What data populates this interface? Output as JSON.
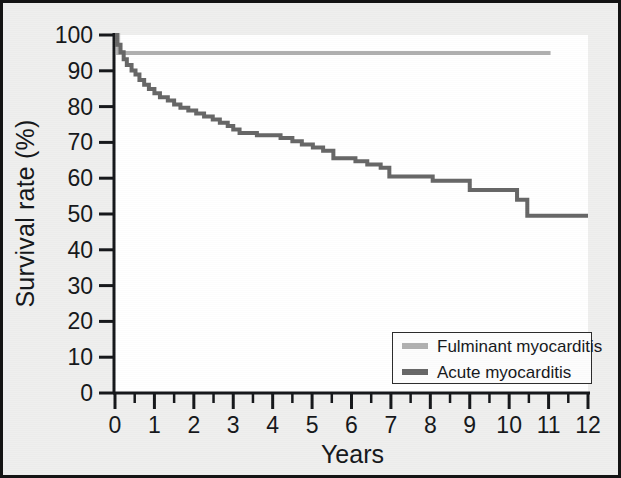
{
  "chart_data": {
    "type": "line",
    "title": "",
    "subtitle": "",
    "xlabel": "Years",
    "ylabel": "Survival rate (%)",
    "xlim": [
      0,
      12
    ],
    "ylim": [
      0,
      100
    ],
    "xticks": [
      0,
      1,
      2,
      3,
      4,
      5,
      6,
      7,
      8,
      9,
      10,
      11,
      12
    ],
    "xtick_labels": [
      "0",
      "1",
      "2",
      "3",
      "4",
      "5",
      "6",
      "7",
      "8",
      "9",
      "10",
      "11",
      "12"
    ],
    "minor_xtick_interval": 0.5,
    "yticks": [
      0,
      10,
      20,
      30,
      40,
      50,
      60,
      70,
      80,
      90,
      100
    ],
    "ytick_labels": [
      "0",
      "10",
      "20",
      "30",
      "40",
      "50",
      "60",
      "70",
      "80",
      "90",
      "100"
    ],
    "grid": false,
    "legend_position": "lower right",
    "plot_style": "kaplan-meier step curve",
    "series": [
      {
        "name": "Fulminant myocarditis",
        "color": "#b0b0b0",
        "line_width": 4,
        "ends_at_x": 11.05,
        "points": [
          [
            0.0,
            100.0
          ],
          [
            0.08,
            100.0
          ],
          [
            0.08,
            95.0
          ],
          [
            11.05,
            95.0
          ]
        ]
      },
      {
        "name": "Acute myocarditis",
        "color": "#666666",
        "line_width": 4,
        "ends_at_x": 12.0,
        "points": [
          [
            0.0,
            100.0
          ],
          [
            0.05,
            100.0
          ],
          [
            0.05,
            97.3
          ],
          [
            0.14,
            97.3
          ],
          [
            0.14,
            95.2
          ],
          [
            0.22,
            95.2
          ],
          [
            0.22,
            93.2
          ],
          [
            0.3,
            93.2
          ],
          [
            0.3,
            91.6
          ],
          [
            0.42,
            91.6
          ],
          [
            0.42,
            90.1
          ],
          [
            0.52,
            90.1
          ],
          [
            0.52,
            89.0
          ],
          [
            0.62,
            89.0
          ],
          [
            0.62,
            87.4
          ],
          [
            0.74,
            87.4
          ],
          [
            0.74,
            86.1
          ],
          [
            0.86,
            86.1
          ],
          [
            0.86,
            84.9
          ],
          [
            1.0,
            84.9
          ],
          [
            1.0,
            83.7
          ],
          [
            1.14,
            83.7
          ],
          [
            1.14,
            82.6
          ],
          [
            1.34,
            82.6
          ],
          [
            1.34,
            81.7
          ],
          [
            1.5,
            81.7
          ],
          [
            1.5,
            80.6
          ],
          [
            1.66,
            80.6
          ],
          [
            1.66,
            79.7
          ],
          [
            1.86,
            79.7
          ],
          [
            1.86,
            78.9
          ],
          [
            2.06,
            78.9
          ],
          [
            2.06,
            78.1
          ],
          [
            2.26,
            78.1
          ],
          [
            2.26,
            77.2
          ],
          [
            2.48,
            77.2
          ],
          [
            2.48,
            76.4
          ],
          [
            2.66,
            76.4
          ],
          [
            2.66,
            75.5
          ],
          [
            2.86,
            75.5
          ],
          [
            2.86,
            74.6
          ],
          [
            3.0,
            74.6
          ],
          [
            3.0,
            73.6
          ],
          [
            3.16,
            73.6
          ],
          [
            3.16,
            72.6
          ],
          [
            3.6,
            72.6
          ],
          [
            3.6,
            72.0
          ],
          [
            4.2,
            72.0
          ],
          [
            4.2,
            71.2
          ],
          [
            4.5,
            71.2
          ],
          [
            4.5,
            70.3
          ],
          [
            4.74,
            70.3
          ],
          [
            4.74,
            69.4
          ],
          [
            5.02,
            69.4
          ],
          [
            5.02,
            68.6
          ],
          [
            5.28,
            68.6
          ],
          [
            5.28,
            67.7
          ],
          [
            5.54,
            67.7
          ],
          [
            5.54,
            65.6
          ],
          [
            6.1,
            65.6
          ],
          [
            6.1,
            64.7
          ],
          [
            6.4,
            64.7
          ],
          [
            6.4,
            63.8
          ],
          [
            6.74,
            63.8
          ],
          [
            6.74,
            62.9
          ],
          [
            6.96,
            62.9
          ],
          [
            6.96,
            60.5
          ],
          [
            8.06,
            60.5
          ],
          [
            8.06,
            59.3
          ],
          [
            9.0,
            59.3
          ],
          [
            9.0,
            56.7
          ],
          [
            10.2,
            56.7
          ],
          [
            10.2,
            54.0
          ],
          [
            10.46,
            54.0
          ],
          [
            10.46,
            49.5
          ],
          [
            12.0,
            49.5
          ]
        ]
      }
    ],
    "annotations": []
  },
  "legend": {
    "items": [
      {
        "label": "Fulminant myocarditis",
        "color": "#b0b0b0"
      },
      {
        "label": "Acute myocarditis",
        "color": "#666666"
      }
    ]
  },
  "axes": {
    "x_title": "Years",
    "y_title": "Survival rate (%)"
  },
  "colors": {
    "frame": "#141414",
    "background": "#efefee",
    "plot_background": "#ffffff",
    "axis": "#15171a",
    "fulminant": "#b0b0b0",
    "acute": "#666666"
  }
}
